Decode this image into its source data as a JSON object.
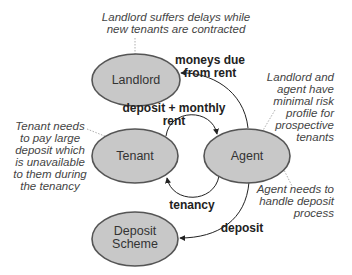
{
  "colors": {
    "node_fill": "#c8c8c8",
    "node_stroke": "#555555",
    "edge": "#222222",
    "leader": "#999999",
    "note_text": "#444444"
  },
  "nodes": {
    "landlord": {
      "label": "Landlord"
    },
    "tenant": {
      "label": "Tenant"
    },
    "agent": {
      "label": "Agent"
    },
    "deposit_scheme": {
      "label_line1": "Deposit",
      "label_line2": "Scheme"
    }
  },
  "edges": {
    "agent_to_landlord": {
      "line1": "moneys due",
      "line2": "from rent"
    },
    "tenant_to_agent": {
      "line1": "deposit + monthly",
      "line2": "rent"
    },
    "agent_to_tenant": {
      "label": "tenancy"
    },
    "agent_to_deposit": {
      "label": "deposit"
    }
  },
  "notes": {
    "landlord": [
      "Landlord suffers delays while",
      "new tenants are contracted"
    ],
    "tenant": [
      "Tenant needs",
      "to pay large",
      "deposit which",
      "is unavailable",
      "to them during",
      "the tenancy"
    ],
    "landlord_agent": [
      "Landlord and",
      "agent have",
      "minimal risk",
      "profile for",
      "prospective",
      "tenants"
    ],
    "agent": [
      "Agent needs to",
      "handle deposit",
      "process"
    ]
  }
}
